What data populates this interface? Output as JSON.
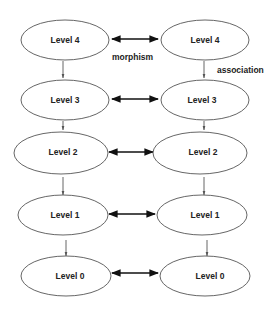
{
  "diagram": {
    "left_column": [
      {
        "label": "Level 4",
        "cx": 65,
        "cy": 40,
        "rx": 44,
        "ry": 20
      },
      {
        "label": "Level 3",
        "cx": 65,
        "cy": 100,
        "rx": 44,
        "ry": 20
      },
      {
        "label": "Level 2",
        "cx": 60,
        "cy": 152,
        "rx": 47,
        "ry": 20
      },
      {
        "label": "Level 1",
        "cx": 62,
        "cy": 217,
        "rx": 45,
        "ry": 20
      },
      {
        "label": "Level 0",
        "cx": 65,
        "cy": 278,
        "rx": 44,
        "ry": 20
      }
    ],
    "right_column": [
      {
        "label": "Level 4",
        "cx": 205,
        "cy": 40,
        "rx": 44,
        "ry": 20
      },
      {
        "label": "Level 3",
        "cx": 205,
        "cy": 100,
        "rx": 44,
        "ry": 20
      },
      {
        "label": "Level 2",
        "cx": 200,
        "cy": 152,
        "rx": 47,
        "ry": 20
      },
      {
        "label": "Level 1",
        "cx": 202,
        "cy": 217,
        "rx": 45,
        "ry": 20
      },
      {
        "label": "Level 0",
        "cx": 205,
        "cy": 278,
        "rx": 44,
        "ry": 20
      }
    ],
    "horizontal_edge_label": "morphism",
    "vertical_edge_label": "association"
  }
}
